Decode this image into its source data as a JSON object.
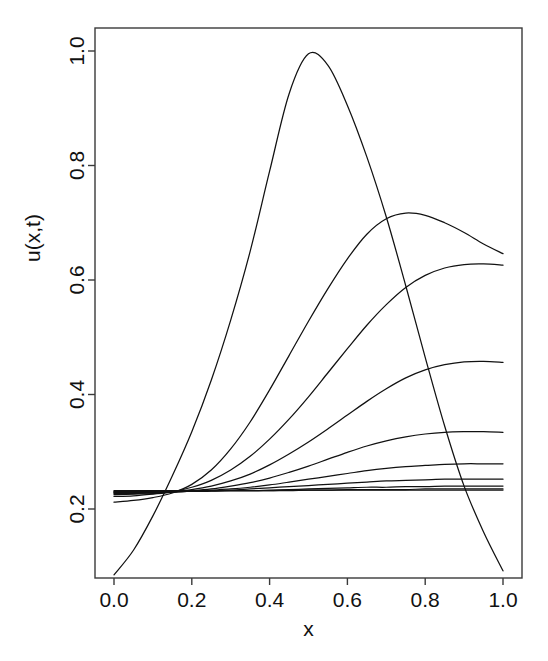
{
  "chart_data": {
    "type": "line",
    "title": "",
    "subtitle": "",
    "xlabel": "x",
    "ylabel": "u(x,t)",
    "xlim": [
      -0.04,
      1.04
    ],
    "ylim": [
      0.055,
      1.035
    ],
    "xticks": [
      0.0,
      0.2,
      0.4,
      0.6,
      0.8,
      1.0
    ],
    "xticklabels": [
      "0.0",
      "0.2",
      "0.4",
      "0.6",
      "0.8",
      "1.0"
    ],
    "yticks": [
      0.2,
      0.4,
      0.6,
      0.8,
      1.0
    ],
    "yticklabels": [
      "0.2",
      "0.4",
      "0.6",
      "0.8",
      "1.0"
    ],
    "grid": false,
    "legend": null,
    "legend_position": "none",
    "box": true,
    "line_color": "#111111",
    "background": "#ffffff",
    "x": [
      0.0,
      0.05,
      0.1,
      0.15,
      0.2,
      0.25,
      0.3,
      0.35,
      0.4,
      0.45,
      0.5,
      0.55,
      0.6,
      0.65,
      0.7,
      0.75,
      0.8,
      0.85,
      0.9,
      0.95,
      1.0
    ],
    "series": [
      {
        "name": "t0",
        "values": [
          0.085,
          0.128,
          0.188,
          0.258,
          0.335,
          0.425,
          0.53,
          0.65,
          0.79,
          0.925,
          0.995,
          0.975,
          0.905,
          0.815,
          0.71,
          0.59,
          0.465,
          0.345,
          0.24,
          0.16,
          0.092
        ]
      },
      {
        "name": "t1",
        "values": [
          0.212,
          0.215,
          0.22,
          0.228,
          0.243,
          0.268,
          0.305,
          0.352,
          0.408,
          0.468,
          0.528,
          0.585,
          0.637,
          0.68,
          0.707,
          0.717,
          0.713,
          0.7,
          0.683,
          0.663,
          0.646
        ]
      },
      {
        "name": "t2",
        "values": [
          0.222,
          0.223,
          0.226,
          0.23,
          0.238,
          0.25,
          0.268,
          0.292,
          0.322,
          0.357,
          0.396,
          0.438,
          0.48,
          0.521,
          0.557,
          0.587,
          0.608,
          0.621,
          0.627,
          0.628,
          0.626
        ]
      },
      {
        "name": "t3",
        "values": [
          0.225,
          0.226,
          0.227,
          0.23,
          0.234,
          0.24,
          0.249,
          0.261,
          0.277,
          0.296,
          0.317,
          0.34,
          0.364,
          0.388,
          0.41,
          0.429,
          0.443,
          0.452,
          0.457,
          0.458,
          0.456
        ]
      },
      {
        "name": "t4",
        "values": [
          0.227,
          0.227,
          0.228,
          0.23,
          0.232,
          0.235,
          0.24,
          0.246,
          0.254,
          0.264,
          0.275,
          0.287,
          0.299,
          0.31,
          0.319,
          0.326,
          0.331,
          0.334,
          0.335,
          0.335,
          0.334
        ]
      },
      {
        "name": "t5",
        "values": [
          0.228,
          0.228,
          0.229,
          0.23,
          0.231,
          0.233,
          0.235,
          0.238,
          0.242,
          0.247,
          0.252,
          0.257,
          0.262,
          0.267,
          0.271,
          0.274,
          0.276,
          0.278,
          0.279,
          0.279,
          0.279
        ]
      },
      {
        "name": "t6",
        "values": [
          0.229,
          0.229,
          0.229,
          0.23,
          0.231,
          0.232,
          0.233,
          0.235,
          0.237,
          0.239,
          0.241,
          0.243,
          0.245,
          0.247,
          0.249,
          0.25,
          0.251,
          0.252,
          0.252,
          0.252,
          0.252
        ]
      },
      {
        "name": "t7",
        "values": [
          0.23,
          0.23,
          0.23,
          0.23,
          0.231,
          0.231,
          0.232,
          0.232,
          0.233,
          0.234,
          0.235,
          0.236,
          0.237,
          0.238,
          0.238,
          0.239,
          0.239,
          0.24,
          0.24,
          0.24,
          0.24
        ]
      },
      {
        "name": "t8",
        "values": [
          0.231,
          0.231,
          0.231,
          0.231,
          0.231,
          0.232,
          0.232,
          0.232,
          0.232,
          0.233,
          0.233,
          0.233,
          0.234,
          0.234,
          0.234,
          0.234,
          0.235,
          0.235,
          0.235,
          0.235,
          0.235
        ]
      },
      {
        "name": "t9",
        "values": [
          0.232,
          0.232,
          0.232,
          0.232,
          0.232,
          0.232,
          0.232,
          0.232,
          0.232,
          0.232,
          0.233,
          0.233,
          0.233,
          0.233,
          0.233,
          0.233,
          0.233,
          0.233,
          0.233,
          0.233,
          0.233
        ]
      }
    ]
  },
  "geometry": {
    "plot_left": 95,
    "plot_right": 522,
    "plot_top": 28,
    "plot_bottom": 578,
    "x_pixel_at_0": 114,
    "x_pixel_at_1": 503,
    "y_pixel_at_0_2": 509,
    "y_pixel_at_1_0": 51,
    "tick_length": 7
  }
}
